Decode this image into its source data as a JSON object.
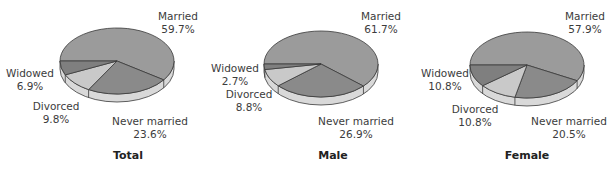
{
  "chart_data": [
    {
      "type": "pie",
      "title": "Total",
      "categories": [
        "Married",
        "Never married",
        "Divorced",
        "Widowed"
      ],
      "values": [
        59.7,
        23.6,
        9.8,
        6.9
      ],
      "labels": [
        "59.7%",
        "23.6%",
        "9.8%",
        "6.9%"
      ],
      "style": "3d-pie"
    },
    {
      "type": "pie",
      "title": "Male",
      "categories": [
        "Married",
        "Never married",
        "Divorced",
        "Widowed"
      ],
      "values": [
        61.7,
        26.9,
        8.8,
        2.7
      ],
      "labels": [
        "61.7%",
        "26.9%",
        "8.8%",
        "2.7%"
      ],
      "style": "3d-pie"
    },
    {
      "type": "pie",
      "title": "Female",
      "categories": [
        "Married",
        "Never married",
        "Divorced",
        "Widowed"
      ],
      "values": [
        57.9,
        20.5,
        10.8,
        10.8
      ],
      "labels": [
        "57.9%",
        "20.5%",
        "10.8%",
        "10.8%"
      ],
      "style": "3d-pie"
    }
  ],
  "colors": {
    "married": "#9b9b9b",
    "never_married": "#8a8a8a",
    "divorced": "#c9c9c9",
    "widowed": "#7f7f7f",
    "side": "#d9d9d9",
    "edge": "#3a3a3a"
  },
  "panels": [
    {
      "title": "Total",
      "married": {
        "name": "Married",
        "pct": "59.7%"
      },
      "never_married": {
        "name": "Never married",
        "pct": "23.6%"
      },
      "divorced": {
        "name": "Divorced",
        "pct": "9.8%"
      },
      "widowed": {
        "name": "Widowed",
        "pct": "6.9%"
      }
    },
    {
      "title": "Male",
      "married": {
        "name": "Married",
        "pct": "61.7%"
      },
      "never_married": {
        "name": "Never married",
        "pct": "26.9%"
      },
      "divorced": {
        "name": "Divorced",
        "pct": "8.8%"
      },
      "widowed": {
        "name": "Widowed",
        "pct": "2.7%"
      }
    },
    {
      "title": "Female",
      "married": {
        "name": "Married",
        "pct": "57.9%"
      },
      "never_married": {
        "name": "Never married",
        "pct": "20.5%"
      },
      "divorced": {
        "name": "Divorced",
        "pct": "10.8%"
      },
      "widowed": {
        "name": "Widowed",
        "pct": "10.8%"
      }
    }
  ]
}
